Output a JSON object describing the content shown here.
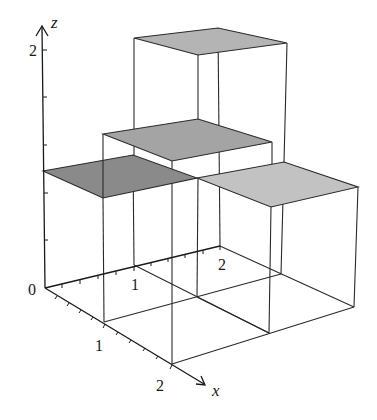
{
  "diagram": {
    "type": "3d-bar-plot",
    "axes": {
      "z": {
        "label": "z",
        "tick_labels": [
          "0",
          "2"
        ]
      },
      "x": {
        "label": "x",
        "tick_labels": [
          "1",
          "2"
        ]
      },
      "y": {
        "tick_labels": [
          "1",
          "2"
        ]
      }
    },
    "origin_label": "0",
    "cells": [
      {
        "name": "cell-x0-1-y0-1",
        "height": 1,
        "shade": "#8a8a8a"
      },
      {
        "name": "cell-x0-1-y1-2",
        "height": 2,
        "shade": "#b4b4b4"
      },
      {
        "name": "cell-x1-2-y0-1",
        "height": 1.6,
        "shade": "#a4a4a4"
      },
      {
        "name": "cell-x1-2-y1-2",
        "height": 1.1,
        "shade": "#c2c2c2"
      }
    ]
  }
}
